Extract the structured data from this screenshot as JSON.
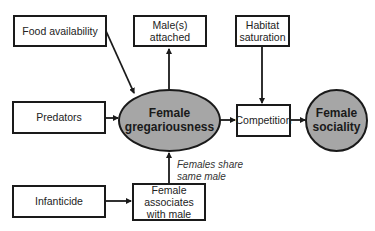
{
  "nodes": {
    "food": "Food availability",
    "male_attached": "Male(s) attached",
    "habitat_1": "Habitat",
    "habitat_2": "saturation",
    "predators": "Predators",
    "gregarious_1": "Female",
    "gregarious_2": "gregariousness",
    "competition": "Competition",
    "sociality_1": "Female",
    "sociality_2": "sociality",
    "infanticide": "Infanticide",
    "associates_1": "Female",
    "associates_2": "associates",
    "associates_3": "with male"
  },
  "annotations": {
    "share_1": "Females share",
    "share_2": "same male"
  },
  "edges": [
    {
      "from": "Food availability",
      "to": "Female gregariousness"
    },
    {
      "from": "Predators",
      "to": "Female gregariousness"
    },
    {
      "from": "Female gregariousness",
      "to": "Male(s) attached"
    },
    {
      "from": "Female associates with male",
      "to": "Female gregariousness",
      "label": "Females share same male"
    },
    {
      "from": "Infanticide",
      "to": "Female associates with male"
    },
    {
      "from": "Habitat saturation",
      "to": "Competition"
    },
    {
      "from": "Female gregariousness",
      "to": "Competition"
    },
    {
      "from": "Competition",
      "to": "Female sociality"
    }
  ]
}
